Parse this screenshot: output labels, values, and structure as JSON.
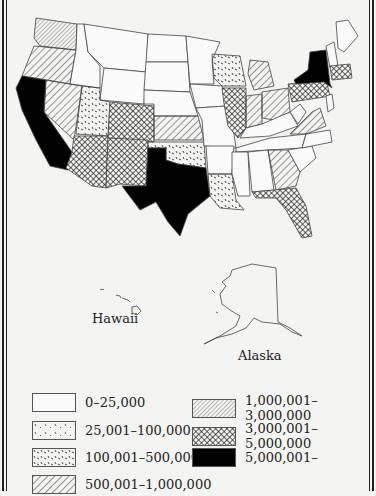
{
  "map": {
    "type": "choropleth",
    "region": "United States",
    "insets": [
      {
        "name": "hawaii",
        "label": "Hawaii"
      },
      {
        "name": "alaska",
        "label": "Alaska"
      }
    ]
  },
  "legend": {
    "items": [
      {
        "pattern": "blank",
        "label": "0–25,000"
      },
      {
        "pattern": "sparse-dashes",
        "label": "25,001–100,000"
      },
      {
        "pattern": "dense-dashes",
        "label": "100,001–500,000"
      },
      {
        "pattern": "wide-hatch",
        "label": "500,001–1,000,000"
      },
      {
        "pattern": "fine-hatch",
        "label": "1,000,001–3,000,000"
      },
      {
        "pattern": "crosshatch",
        "label": "3,000,001–5,000,000"
      },
      {
        "pattern": "solid-black",
        "label": "5,000,001–"
      }
    ]
  },
  "colors": {
    "background": "#f4f4f2",
    "ink": "#222222",
    "solid": "#000000"
  }
}
